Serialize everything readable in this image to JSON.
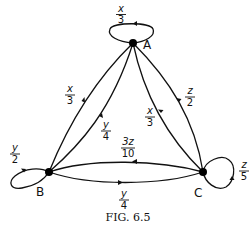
{
  "figure": {
    "caption": "Fig. 6.5",
    "caption_display": "FIG. 6.5"
  },
  "nodes": [
    {
      "id": "A",
      "label": "A"
    },
    {
      "id": "B",
      "label": "B"
    },
    {
      "id": "C",
      "label": "C"
    }
  ],
  "edges": [
    {
      "from": "A",
      "to": "A",
      "label_num": "x",
      "label_den": "3",
      "label": "x/3"
    },
    {
      "from": "A",
      "to": "B",
      "label_num": "x",
      "label_den": "3",
      "label": "x/3"
    },
    {
      "from": "B",
      "to": "A",
      "label_num": "y",
      "label_den": "4",
      "label": "y/4"
    },
    {
      "from": "A",
      "to": "C",
      "label_num": "x",
      "label_den": "3",
      "label": "x/3"
    },
    {
      "from": "C",
      "to": "A",
      "label_num": "z",
      "label_den": "2",
      "label": "z/2"
    },
    {
      "from": "C",
      "to": "B",
      "label_num": "3z",
      "label_den": "10",
      "label": "3z/10"
    },
    {
      "from": "B",
      "to": "C",
      "label_num": "y",
      "label_den": "4",
      "label": "y/4"
    },
    {
      "from": "B",
      "to": "B",
      "label_num": "y",
      "label_den": "2",
      "label": "y/2"
    },
    {
      "from": "C",
      "to": "C",
      "label_num": "z",
      "label_den": "5",
      "label": "z/5"
    }
  ]
}
